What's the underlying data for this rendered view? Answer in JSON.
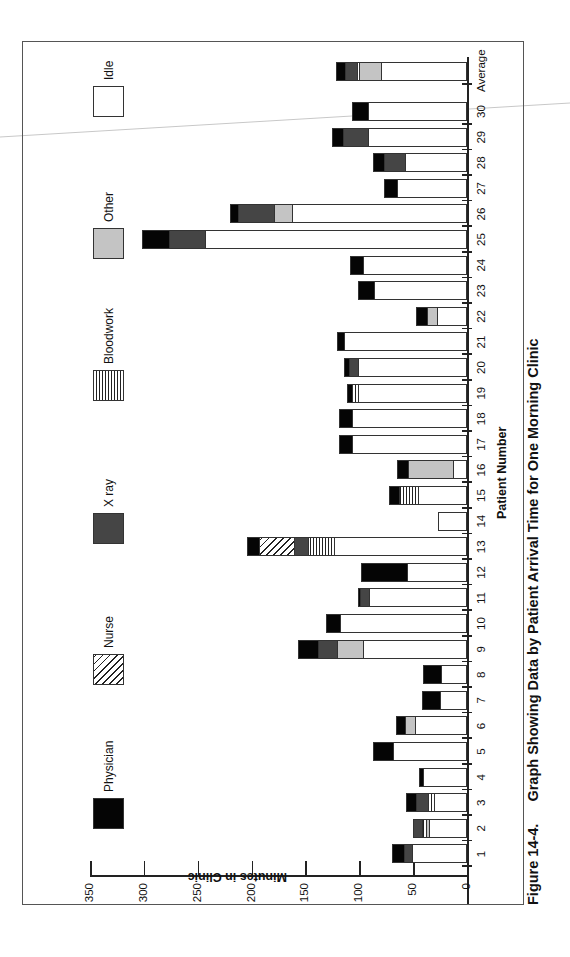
{
  "figure": {
    "number": "Figure 14-4.",
    "title": "Graph Showing Data by Patient Arrival Time for One Morning Clinic"
  },
  "legend": [
    {
      "key": "idle",
      "label": "Idle"
    },
    {
      "key": "other",
      "label": "Other"
    },
    {
      "key": "blood",
      "label": "Bloodwork"
    },
    {
      "key": "xray",
      "label": "X ray"
    },
    {
      "key": "nurse",
      "label": "Nurse"
    },
    {
      "key": "phys",
      "label": "Physician"
    }
  ],
  "axes": {
    "y_title": "Minutes in Clinic",
    "x_title": "Patient Number",
    "y_ticks": [
      "0",
      "50",
      "100",
      "150",
      "200",
      "250",
      "300",
      "350"
    ]
  },
  "chart_data": {
    "type": "bar",
    "stacked": true,
    "orientation": "vertical (figure printed rotated 90°)",
    "title": "Figure 14-4. Graph Showing Data by Patient Arrival Time for One Morning Clinic",
    "xlabel": "Patient Number",
    "ylabel": "Minutes in Clinic",
    "ylim": [
      0,
      350
    ],
    "y_ticks": [
      0,
      50,
      100,
      150,
      200,
      250,
      300,
      350
    ],
    "grid": false,
    "legend_position": "top (left side of rotated page)",
    "categories": [
      "1",
      "2",
      "3",
      "4",
      "5",
      "6",
      "7",
      "8",
      "9",
      "10",
      "11",
      "12",
      "13",
      "14",
      "15",
      "16",
      "17",
      "18",
      "19",
      "20",
      "21",
      "22",
      "23",
      "24",
      "25",
      "26",
      "27",
      "28",
      "29",
      "30",
      "Average"
    ],
    "series": [
      {
        "name": "Idle",
        "values": [
          50,
          34,
          30,
          40,
          68,
          47,
          24,
          23,
          96,
          117,
          90,
          55,
          123,
          27,
          45,
          12,
          106,
          106,
          100,
          100,
          113,
          27,
          85,
          96,
          242,
          162,
          64,
          57,
          91,
          91,
          79
        ]
      },
      {
        "name": "Other",
        "values": [
          0,
          3,
          0,
          0,
          0,
          10,
          0,
          0,
          24,
          0,
          0,
          0,
          0,
          0,
          0,
          42,
          0,
          0,
          0,
          0,
          0,
          9,
          0,
          0,
          0,
          16,
          0,
          0,
          0,
          0,
          20
        ]
      },
      {
        "name": "Bloodwork",
        "values": [
          0,
          4,
          5,
          0,
          0,
          0,
          0,
          0,
          0,
          0,
          0,
          0,
          24,
          0,
          17,
          0,
          0,
          0,
          6,
          0,
          0,
          0,
          0,
          0,
          0,
          0,
          0,
          0,
          0,
          0,
          2
        ]
      },
      {
        "name": "X ray",
        "values": [
          8,
          9,
          11,
          0,
          0,
          0,
          0,
          0,
          17,
          0,
          8,
          0,
          13,
          0,
          0,
          0,
          0,
          0,
          0,
          9,
          0,
          0,
          0,
          0,
          34,
          34,
          0,
          19,
          23,
          0,
          11
        ]
      },
      {
        "name": "Nurse",
        "values": [
          0,
          0,
          0,
          0,
          0,
          0,
          0,
          0,
          0,
          0,
          0,
          0,
          32,
          0,
          0,
          0,
          0,
          0,
          0,
          0,
          0,
          0,
          0,
          0,
          0,
          0,
          0,
          0,
          0,
          0,
          0
        ]
      },
      {
        "name": "Physician",
        "values": [
          12,
          0,
          11,
          5,
          19,
          9,
          18,
          18,
          20,
          14,
          3,
          43,
          12,
          0,
          10,
          11,
          13,
          13,
          5,
          5,
          8,
          11,
          16,
          13,
          26,
          8,
          13,
          11,
          11,
          16,
          10
        ]
      }
    ],
    "totals": [
      70,
      50,
      57,
      45,
      87,
      66,
      42,
      41,
      157,
      131,
      101,
      98,
      204,
      27,
      72,
      65,
      119,
      119,
      111,
      114,
      121,
      47,
      101,
      109,
      302,
      220,
      77,
      87,
      125,
      107,
      122
    ]
  }
}
